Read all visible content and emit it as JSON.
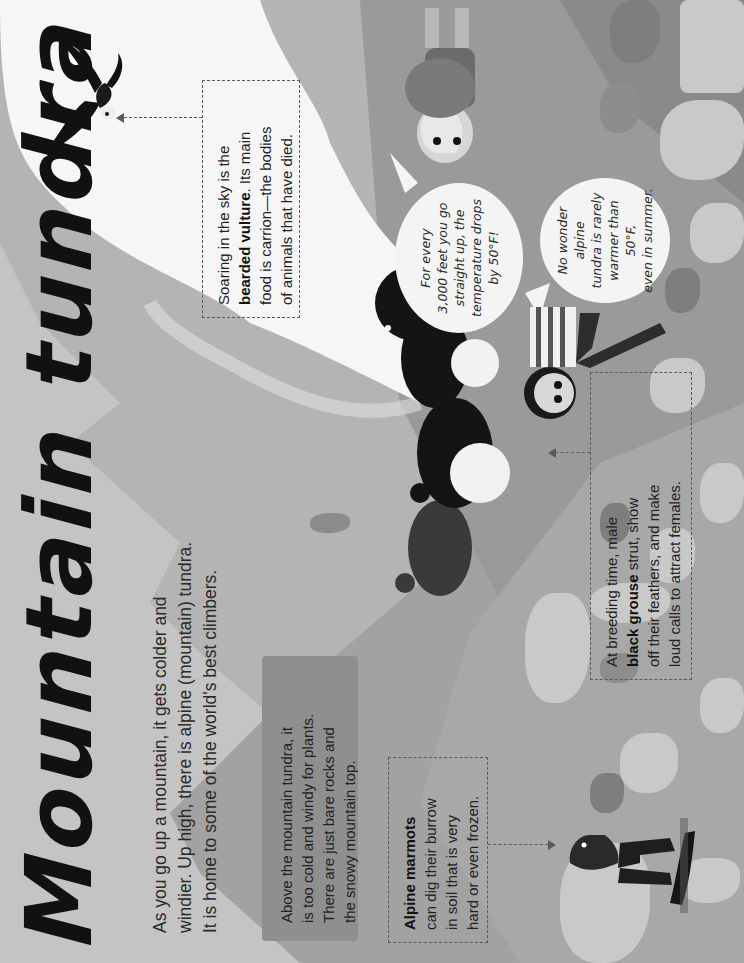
{
  "page": {
    "title": "Mountain tundra",
    "orientation": "rotated 90° counter-clockwise",
    "intro": {
      "line1": "As you go up a mountain, it gets colder and",
      "line2": "windier. Up high, there is alpine (mountain) tundra.",
      "line3": "It is home to some of the world's best climbers."
    },
    "above_tundra_box": {
      "line1": "Above the mountain tundra, it",
      "line2": "is too cold and windy for plants.",
      "line3": "There are just bare rocks and",
      "line4": "the snowy mountain top."
    },
    "marmot_callout": {
      "bold": "Alpine marmots",
      "line1": "can dig their burrow",
      "line2": "in soil that is very",
      "line3": "hard or even frozen."
    },
    "grouse_callout": {
      "line1": "At breeding time, male",
      "bold": "black grouse",
      "line2_rest": " strut, show",
      "line3": "off their feathers, and make",
      "line4": "loud calls to attract females."
    },
    "vulture_callout": {
      "line1": "Soaring in the sky is the",
      "bold": "bearded vulture",
      "line2_rest": ". Its main",
      "line3": "food is carrion—the bodies",
      "line4": "of animals that have died."
    },
    "speech_bubbles": {
      "climber": {
        "line1": "For every",
        "line2": "3,000 feet you go",
        "line3": "straight up, the",
        "line4": "temperature drops",
        "line5": "by 50°F!"
      },
      "kid": {
        "line1": "No wonder alpine",
        "line2": "tundra is rarely",
        "line3": "warmer than 50°F,",
        "line4": "even in summer."
      }
    },
    "illustrations": [
      "bearded-vulture",
      "black-grouse-male-1",
      "black-grouse-male-2",
      "black-grouse-male-3",
      "black-grouse-female",
      "alpine-marmot",
      "mountaineer-with-backpack",
      "child-striped-shirt",
      "snowy-peak",
      "rocks"
    ]
  },
  "colors": {
    "background_light": "#c4c4c4",
    "mountain_band": "#a2a2a2",
    "ground": "#9c9c9c",
    "info_box": "#8f8f8f",
    "snow": "#f7f7f7",
    "text": "#2a2a2a",
    "title": "#111111"
  }
}
